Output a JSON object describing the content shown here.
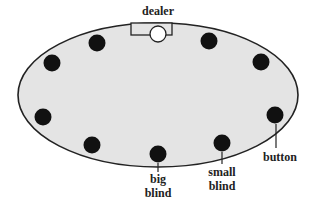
{
  "diagram": {
    "colors": {
      "table_fill": "#e4e4e4",
      "table_stroke": "#222222",
      "seat": "#111111",
      "dealer_button": "#ffffff"
    },
    "labels": {
      "dealer": "dealer",
      "button": "button",
      "small_blind_1": "small",
      "small_blind_2": "blind",
      "big_blind_1": "big",
      "big_blind_2": "blind"
    },
    "seat_count": 9
  }
}
